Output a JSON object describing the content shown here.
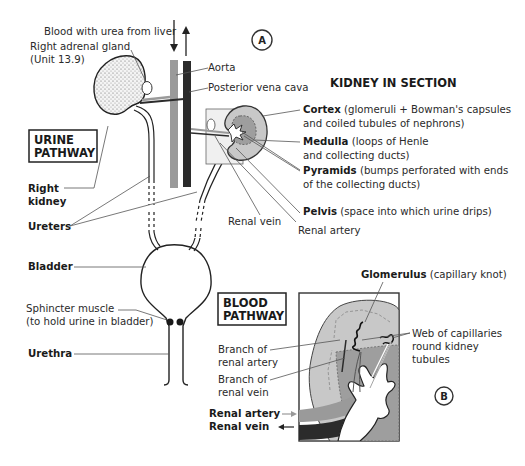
{
  "figure": {
    "markers": {
      "a": "A",
      "b": "B"
    },
    "colors": {
      "vein": "#9a9a9a",
      "artery": "#2b2b2b",
      "cortex": "#c8c8c8",
      "medulla": "#9e9e9e",
      "kidney_outline": "#333333",
      "background": "#ffffff"
    }
  },
  "urinary_system": {
    "title_box": [
      "URINE",
      "PATHWAY"
    ],
    "labels": {
      "blood_from_liver": "Blood with urea from liver",
      "adrenal_gland": "Right adrenal gland",
      "adrenal_ref": "(Unit 13.9)",
      "aorta": "Aorta",
      "vena_cava": "Posterior vena cava",
      "right_kidney_1": "Right",
      "right_kidney_2": "kidney",
      "ureters": "Ureters",
      "bladder": "Bladder",
      "sphincter_1": "Sphincter muscle",
      "sphincter_2": "(to hold urine in bladder)",
      "urethra": "Urethra",
      "renal_vein": "Renal vein",
      "renal_artery": "Renal artery"
    }
  },
  "kidney_section": {
    "title": "KIDNEY IN SECTION",
    "parts": [
      {
        "name": "Cortex",
        "desc_1": " (glomeruli + Bowman's capsules",
        "desc_2": "and coiled tubules of nephrons)"
      },
      {
        "name": "Medulla",
        "desc_1": " (loops of Henle",
        "desc_2": "and collecting ducts)"
      },
      {
        "name": "Pyramids",
        "desc_1": " (bumps perforated with ends",
        "desc_2": "of the collecting ducts)"
      },
      {
        "name": "Pelvis",
        "desc_1": " (space into which urine drips)",
        "desc_2": ""
      }
    ]
  },
  "blood_pathway": {
    "title_box": [
      "BLOOD",
      "PATHWAY"
    ],
    "glomerulus_name": "Glomerulus",
    "glomerulus_desc": " (capillary knot)",
    "web_1": "Web of capillaries",
    "web_2": "round kidney",
    "web_3": "tubules",
    "branch_artery_1": "Branch of",
    "branch_artery_2": "renal artery",
    "branch_vein_1": "Branch of",
    "branch_vein_2": "renal vein",
    "renal_artery": "Renal artery",
    "renal_vein": "Renal vein"
  }
}
